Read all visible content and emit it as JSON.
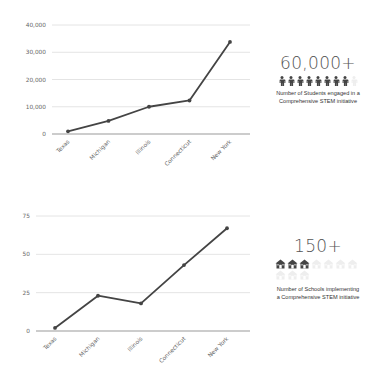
{
  "chart_data": [
    {
      "type": "line",
      "title": "",
      "xlabel": "",
      "ylabel": "",
      "categories": [
        "Texas",
        "Michigan",
        "Illinois",
        "Connecticut",
        "New York"
      ],
      "values": [
        1000,
        4800,
        10000,
        12300,
        33800
      ],
      "yticks": [
        "0",
        "10,000",
        "20,000",
        "30,000",
        "40,000"
      ],
      "ylim": [
        0,
        40000
      ],
      "grid": true,
      "line_color": "#444444"
    },
    {
      "type": "line",
      "title": "",
      "xlabel": "",
      "ylabel": "",
      "categories": [
        "Texas",
        "Michigan",
        "Illinois",
        "Connecticut",
        "New York"
      ],
      "values": [
        2,
        23,
        18,
        43,
        67
      ],
      "yticks": [
        "0",
        "25",
        "50",
        "75"
      ],
      "ylim": [
        0,
        75
      ],
      "grid": true,
      "line_color": "#444444"
    }
  ],
  "stats": [
    {
      "number": "60,000+",
      "icon": "person-icon",
      "icons_filled": 8,
      "icons_faded": 1,
      "caption": "Number of Students engaged in a Comprehensive STEM initiative"
    },
    {
      "number": "150+",
      "icon": "school-icon",
      "icons_filled": 3,
      "icons_faded": 7,
      "caption": "Number of Schools implementing a Comprehensive STEM initiative"
    }
  ]
}
